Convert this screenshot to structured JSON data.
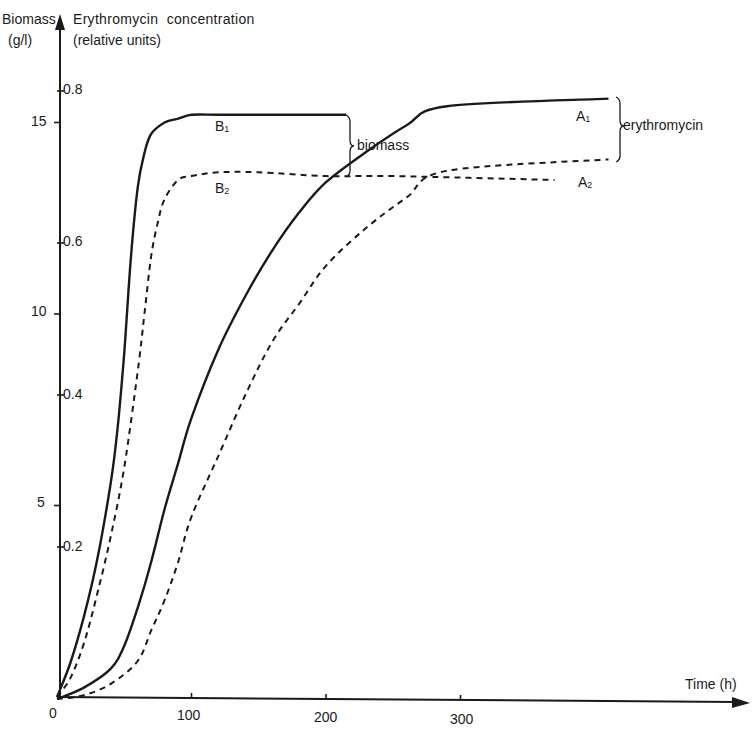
{
  "chart_data": {
    "type": "line",
    "title": "",
    "xlabel": "Time (h)",
    "ylabel_left": "Biomass (g/l)",
    "ylabel_right": "Erythromycin concentration (relative units)",
    "xlim": [
      0,
      330
    ],
    "ylim_biomass": [
      0,
      17
    ],
    "ylim_erythromycin": [
      0,
      0.9
    ],
    "grid": false,
    "x_ticks": [
      "0",
      "100",
      "200",
      "300"
    ],
    "biomass_ticks": [
      "5",
      "10",
      "15"
    ],
    "erythromycin_ticks": [
      "0.2",
      "0.4",
      "0.6",
      "0.8"
    ],
    "annotations": [
      "biomass",
      "erythromycin"
    ],
    "series": [
      {
        "name": "B1",
        "group": "biomass",
        "style": "solid",
        "axis": "biomass",
        "x": [
          0,
          10,
          20,
          30,
          40,
          45,
          50,
          55,
          60,
          65,
          70,
          80,
          90,
          100,
          120,
          150,
          180,
          215
        ],
        "y": [
          0,
          0.9,
          2.1,
          3.6,
          5.6,
          7.0,
          9.0,
          11.5,
          13.3,
          14.2,
          14.7,
          15.0,
          15.1,
          15.2,
          15.2,
          15.2,
          15.2,
          15.2
        ]
      },
      {
        "name": "B2",
        "group": "biomass",
        "style": "dashed",
        "axis": "biomass",
        "x": [
          0,
          10,
          20,
          30,
          40,
          50,
          60,
          65,
          70,
          75,
          80,
          90,
          100,
          120,
          150,
          200,
          250,
          370
        ],
        "y": [
          0,
          0.5,
          1.4,
          2.7,
          4.2,
          6.0,
          8.5,
          10.0,
          11.5,
          12.4,
          13.0,
          13.5,
          13.6,
          13.7,
          13.7,
          13.6,
          13.6,
          13.5
        ]
      },
      {
        "name": "A1",
        "group": "erythromycin",
        "style": "solid",
        "axis": "erythromycin",
        "x": [
          0,
          20,
          40,
          50,
          60,
          70,
          80,
          90,
          100,
          120,
          140,
          160,
          180,
          200,
          230,
          260,
          290,
          410
        ],
        "y": [
          0,
          0.015,
          0.04,
          0.07,
          0.12,
          0.18,
          0.25,
          0.31,
          0.37,
          0.46,
          0.53,
          0.59,
          0.64,
          0.68,
          0.72,
          0.755,
          0.78,
          0.79
        ]
      },
      {
        "name": "A2",
        "group": "erythromycin",
        "style": "dashed",
        "axis": "erythromycin",
        "x": [
          0,
          20,
          40,
          60,
          70,
          80,
          90,
          100,
          120,
          140,
          160,
          180,
          200,
          230,
          260,
          290,
          410
        ],
        "y": [
          0,
          0.005,
          0.02,
          0.05,
          0.09,
          0.13,
          0.18,
          0.24,
          0.32,
          0.4,
          0.47,
          0.52,
          0.57,
          0.62,
          0.66,
          0.695,
          0.71
        ]
      }
    ]
  },
  "labels": {
    "y_left_title": "Biomass",
    "y_left_unit": "(g/l)",
    "y_right_title": "Erythromycin  concentration",
    "y_right_unit": "(relative units)",
    "x_title": "Time (h)",
    "biomass_brace": "biomass",
    "erythromycin_brace": "erythromycin",
    "B1": "B",
    "B1_sub": "1",
    "B2": "B",
    "B2_sub": "2",
    "A1": "A",
    "A1_sub": "1",
    "A2": "A",
    "A2_sub": "2",
    "x_ticks": [
      "0",
      "100",
      "200",
      "300"
    ],
    "biomass_ticks": [
      "5",
      "10",
      "15"
    ],
    "erythromycin_ticks": [
      "0.2",
      "0.4",
      "0.6",
      "0.8"
    ]
  },
  "colors": {
    "ink": "#1a1a1a",
    "background": "#ffffff"
  }
}
